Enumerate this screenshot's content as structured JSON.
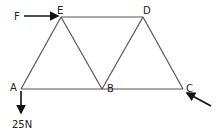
{
  "diagram": {
    "type": "truss",
    "nodes": [
      {
        "id": "A",
        "label": "A",
        "x": 21,
        "y": 89
      },
      {
        "id": "B",
        "label": "B",
        "x": 102,
        "y": 89
      },
      {
        "id": "C",
        "label": "C",
        "x": 183,
        "y": 89
      },
      {
        "id": "D",
        "label": "D",
        "x": 143,
        "y": 17
      },
      {
        "id": "E",
        "label": "E",
        "x": 61,
        "y": 17
      }
    ],
    "members": [
      [
        "A",
        "E"
      ],
      [
        "E",
        "B"
      ],
      [
        "B",
        "D"
      ],
      [
        "D",
        "C"
      ],
      [
        "A",
        "B"
      ],
      [
        "B",
        "C"
      ],
      [
        "E",
        "D"
      ]
    ],
    "forces": [
      {
        "label": "F",
        "at": "E",
        "direction": "right"
      },
      {
        "label": "25N",
        "at": "A",
        "direction": "down"
      },
      {
        "label": "",
        "at": "C",
        "direction": "up-left"
      }
    ]
  },
  "labels": {
    "A": "A",
    "B": "B",
    "C": "C",
    "D": "D",
    "E": "E",
    "F": "F",
    "load": "25N"
  },
  "colors": {
    "member": "#555555",
    "force": "#111111",
    "text": "#222222"
  }
}
